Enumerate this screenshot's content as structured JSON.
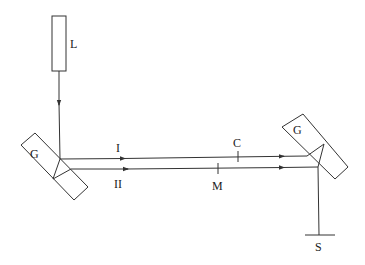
{
  "diagram": {
    "labels": {
      "source": "L",
      "plate_left": "G",
      "plate_right": "G",
      "ray_1": "I",
      "ray_2": "II",
      "compensator": "C",
      "medium": "M",
      "screen": "S"
    },
    "colors": {
      "line": "#333333",
      "text": "#222222",
      "background": "#ffffff"
    }
  }
}
